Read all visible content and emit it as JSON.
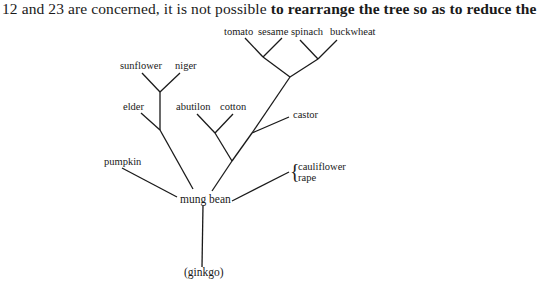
{
  "text": {
    "top_line_prefix": "12 and 23 are concerned, it is not possible ",
    "top_line_bold": "to rearrange the tree so as to reduce the"
  },
  "tree": {
    "leaves": {
      "tomato": "tomato",
      "sesame": "sesame",
      "spinach": "spinach",
      "buckwheat": "buckwheat",
      "sunflower": "sunflower",
      "niger": "niger",
      "elder": "elder",
      "abutilon": "abutilon",
      "cotton": "cotton",
      "castor": "castor",
      "pumpkin": "pumpkin",
      "cauliflower": "cauliflower",
      "rape": "rape"
    },
    "root_label": "mung bean",
    "outgroup_label": "(ginkgo)",
    "brace_symbol": "{",
    "topology": "((((tomato,sesame),(spinach,buckwheat)),castor),(abutilon,cotton)),(((sunflower,niger),elder)),pumpkin,(cauliflower,rape) — joined at mung bean; rooted with (ginkgo)"
  }
}
